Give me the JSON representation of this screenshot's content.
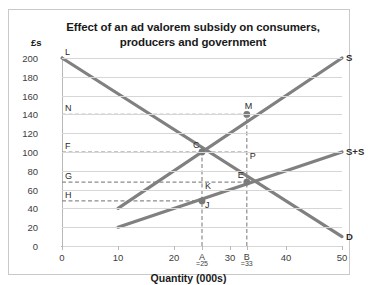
{
  "chart_data": {
    "type": "line",
    "title": "Effect of an ad valorem subsidy on consumers, producers and government",
    "title_line1": "Effect of an ad valorem subsidy on consumers,",
    "title_line2": "producers and government",
    "xlabel": "Quantity (000s)",
    "ylabel": "£s",
    "xlim": [
      0,
      50
    ],
    "ylim": [
      0,
      200
    ],
    "xticks": [
      0,
      10,
      20,
      30,
      40,
      50
    ],
    "xtick_labels": [
      "0",
      "10",
      "20",
      "30",
      "40",
      "50"
    ],
    "yticks": [
      0,
      20,
      40,
      60,
      80,
      100,
      120,
      140,
      160,
      180,
      200
    ],
    "ytick_labels": [
      "0",
      "20",
      "40",
      "60",
      "80",
      "100",
      "120",
      "140",
      "160",
      "180",
      "200"
    ],
    "grid": true,
    "legend_position": "inline-right",
    "line_color": "#808080",
    "grid_color": "#d6d6d6",
    "series": [
      {
        "name": "D",
        "label": "D",
        "points": [
          [
            0,
            200
          ],
          [
            50,
            10
          ]
        ],
        "label_at": [
          50,
          10
        ]
      },
      {
        "name": "S",
        "label": "S",
        "points": [
          [
            10,
            40
          ],
          [
            50,
            200
          ]
        ],
        "label_at": [
          50,
          200
        ]
      },
      {
        "name": "S+S",
        "label": "S+S",
        "points": [
          [
            10,
            20
          ],
          [
            50,
            100
          ]
        ],
        "label_at": [
          50,
          100
        ]
      }
    ],
    "annotated_points": [
      {
        "label": "L",
        "x": 0,
        "y": 200,
        "marker": false,
        "anchor": "above-right"
      },
      {
        "label": "N",
        "x": 0,
        "y": 140,
        "marker": false,
        "anchor": "above-right"
      },
      {
        "label": "F",
        "x": 0,
        "y": 100,
        "marker": false,
        "anchor": "above-right"
      },
      {
        "label": "G",
        "x": 0,
        "y": 68,
        "marker": false,
        "anchor": "above-right"
      },
      {
        "label": "H",
        "x": 0,
        "y": 48,
        "marker": false,
        "anchor": "above-right"
      },
      {
        "label": "C",
        "x": 25,
        "y": 100,
        "marker": true,
        "anchor": "above-left"
      },
      {
        "label": "M",
        "x": 33,
        "y": 140,
        "marker": true,
        "anchor": "above"
      },
      {
        "label": "P",
        "x": 33,
        "y": 100,
        "marker": false,
        "anchor": "below-right"
      },
      {
        "label": "K",
        "x": 25,
        "y": 68,
        "marker": false,
        "anchor": "below-right"
      },
      {
        "label": "E",
        "x": 33,
        "y": 68,
        "marker": true,
        "anchor": "above-left"
      },
      {
        "label": "J",
        "x": 25,
        "y": 48,
        "marker": true,
        "anchor": "below-right"
      }
    ],
    "dashed_horizontals": [
      {
        "from_label": "N",
        "y": 140,
        "x_start": 0,
        "x_end": 33
      },
      {
        "from_label": "F",
        "y": 100,
        "x_start": 0,
        "x_end": 33
      },
      {
        "from_label": "G",
        "y": 68,
        "x_start": 0,
        "x_end": 33
      },
      {
        "from_label": "H",
        "y": 48,
        "x_start": 0,
        "x_end": 25
      }
    ],
    "dashed_verticals": [
      {
        "label": "A",
        "x": 25,
        "y_start": 0,
        "y_end": 100
      },
      {
        "label": "B",
        "x": 33,
        "y_start": 0,
        "y_end": 140
      }
    ],
    "x_markers": [
      {
        "label": "A",
        "sub": "=25",
        "x": 25
      },
      {
        "label": "B",
        "sub": "=33",
        "x": 33
      }
    ]
  }
}
